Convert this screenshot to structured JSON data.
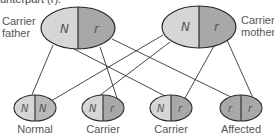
{
  "caption_fragment": "unterpart (r).",
  "colors": {
    "normal_allele": "#d6d6d6",
    "recessive_allele": "#a8a8a8",
    "outline": "#2a2a2a",
    "line": "#333333",
    "text": "#555555"
  },
  "parents": {
    "father": {
      "label_line1": "Carrier",
      "label_line2": "father",
      "alleles": [
        "N",
        "r"
      ]
    },
    "mother": {
      "label_line1": "Carrier",
      "label_line2": "mother",
      "alleles": [
        "N",
        "r"
      ]
    }
  },
  "children": [
    {
      "label": "Normal",
      "alleles": [
        "N",
        "N"
      ]
    },
    {
      "label": "Carrier",
      "alleles": [
        "N",
        "r"
      ]
    },
    {
      "label": "Carrier",
      "alleles": [
        "N",
        "r"
      ]
    },
    {
      "label": "Affected",
      "alleles": [
        "r",
        "r"
      ]
    }
  ]
}
